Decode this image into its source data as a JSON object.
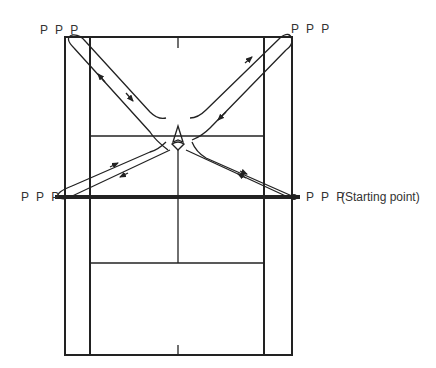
{
  "diagram": {
    "type": "badminton-court-footwork",
    "colors": {
      "line": "#222222",
      "background": "#ffffff"
    },
    "labels": {
      "top_left": "P P P",
      "top_right": "P P P",
      "mid_left": "P P P",
      "mid_right": "P P P",
      "starting_point": "(Starting point)"
    }
  }
}
